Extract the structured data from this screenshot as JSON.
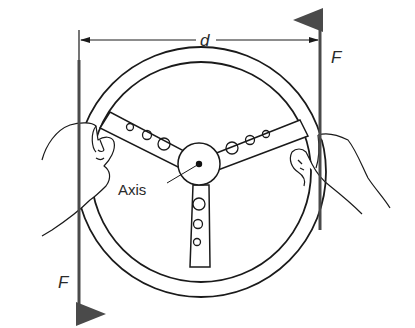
{
  "diagram": {
    "labels": {
      "distance": "d",
      "force_top": "F",
      "force_bottom": "F",
      "axis": "Axis"
    },
    "colors": {
      "line": "#1a1a1a",
      "arrow": "#4a4a4a",
      "background": "#ffffff"
    }
  }
}
